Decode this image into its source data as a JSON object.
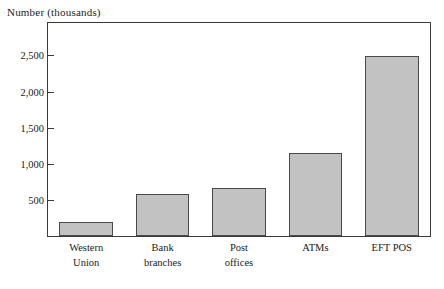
{
  "chart_data": {
    "type": "bar",
    "title": "Number (thousands)",
    "xlabel": "",
    "ylabel": "Number (thousands)",
    "categories": [
      "Western Union",
      "Bank branches",
      "Post offices",
      "ATMs",
      "EFT POS"
    ],
    "category_lines": [
      [
        "Western",
        "Union"
      ],
      [
        "Bank",
        "branches"
      ],
      [
        "Post",
        "offices"
      ],
      [
        "ATMs"
      ],
      [
        "EFT POS"
      ]
    ],
    "values": [
      200,
      575,
      660,
      1150,
      2500
    ],
    "ylim": [
      0,
      2950
    ],
    "yticks": [
      500,
      1000,
      1500,
      2000,
      2500
    ],
    "ytick_labels": [
      "500",
      "1,000",
      "1,500",
      "2,000",
      "2,500"
    ],
    "grid": false,
    "legend": false,
    "bar_fill_color": "#c2c2c2",
    "bar_border_color": "#4a4a4a",
    "axis_color": "#3a3a3a",
    "background_color": "#ffffff"
  }
}
